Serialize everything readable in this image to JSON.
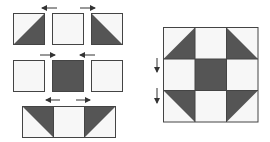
{
  "diagram": {
    "colors": {
      "dark": "#555555",
      "light": "#f7f7f7",
      "border": "#444444",
      "arrow": "#333333"
    },
    "rows": [
      {
        "name": "top-row",
        "cells": [
          "hst-br",
          "plain",
          "hst-bl"
        ],
        "arrows": [
          {
            "direction": "left"
          },
          {
            "direction": "right"
          }
        ]
      },
      {
        "name": "middle-row",
        "cells": [
          "plain",
          "dark",
          "plain"
        ],
        "arrows": [
          {
            "direction": "right"
          },
          {
            "direction": "left"
          }
        ]
      },
      {
        "name": "bottom-row",
        "cells": [
          "hst-tr",
          "plain",
          "hst-tl"
        ],
        "arrows": [
          {
            "direction": "left"
          },
          {
            "direction": "right"
          }
        ]
      }
    ],
    "finished_block": {
      "grid": [
        [
          "hst-br",
          "plain",
          "hst-bl"
        ],
        [
          "plain",
          "dark",
          "plain"
        ],
        [
          "hst-tr",
          "plain",
          "hst-tl"
        ]
      ],
      "seam_arrows": [
        {
          "direction": "down"
        },
        {
          "direction": "down"
        }
      ]
    }
  }
}
